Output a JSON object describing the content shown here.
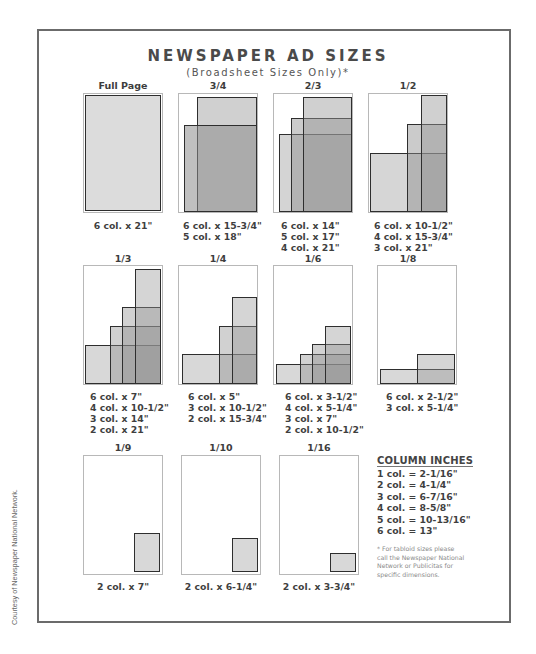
{
  "header": {
    "title": "NEWSPAPER AD SIZES",
    "subtitle": "(Broadsheet Sizes Only)*"
  },
  "colors": {
    "frame": "#6b6b6b",
    "light_fill": "#dcdcdc",
    "mid_fill": "#bdbdbd",
    "dark_fill": "#a2a2a2",
    "darkest_fill": "#8c8c8c",
    "outline": "#2e2e2e"
  },
  "ads": [
    {
      "label": "Full Page",
      "sizes": [
        "6 col. x 21\""
      ]
    },
    {
      "label": "3/4",
      "sizes": [
        "6 col. x 15-3/4\"",
        "5 col. x 18\""
      ]
    },
    {
      "label": "2/3",
      "sizes": [
        "6 col. x 14\"",
        "5 col. x 17\"",
        "4 col. x 21\""
      ]
    },
    {
      "label": "1/2",
      "sizes": [
        "6 col. x 10-1/2\"",
        "4 col. x 15-3/4\"",
        "3 col. x 21\""
      ]
    },
    {
      "label": "1/3",
      "sizes": [
        "6 col. x 7\"",
        "4 col. x 10-1/2\"",
        "3 col. x 14\"",
        "2 col. x 21\""
      ]
    },
    {
      "label": "1/4",
      "sizes": [
        "6 col. x 5\"",
        "3 col. x 10-1/2\"",
        "2 col. x 15-3/4\""
      ]
    },
    {
      "label": "1/6",
      "sizes": [
        "6 col. x 3-1/2\"",
        "4 col. x 5-1/4\"",
        "3 col. x 7\"",
        "2 col. x 10-1/2\""
      ]
    },
    {
      "label": "1/8",
      "sizes": [
        "6 col. x 2-1/2\"",
        "3 col. x 5-1/4\""
      ]
    },
    {
      "label": "1/9",
      "sizes": [
        "2 col. x 7\""
      ]
    },
    {
      "label": "1/10",
      "sizes": [
        "2 col. x 6-1/4\""
      ]
    },
    {
      "label": "1/16",
      "sizes": [
        "2 col. x 3-3/4\""
      ]
    }
  ],
  "column_inches": {
    "heading": "COLUMN INCHES",
    "rows": [
      "1 col. = 2-1/16\"",
      "2 col. = 4-1/4\"",
      "3 col. = 6-7/16\"",
      "4 col. = 8-5/8\"",
      "5 col. = 10-13/16\"",
      "6 col. = 13\""
    ]
  },
  "footnote": "* For tabloid sizes please call the Newspaper National Network or Publicitas for specific dimensions.",
  "credit": "Courtesy of Newspaper National Network."
}
